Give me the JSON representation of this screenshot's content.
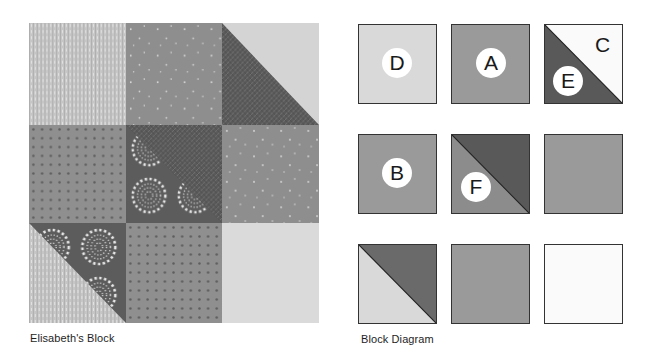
{
  "photo": {
    "caption": "Elisabeth's Block",
    "grid": [
      [
        "text-print-light",
        "sprinkle-medium",
        "hst-crosshatch-dark/light"
      ],
      [
        "dot-medium",
        "hst-flower-dark/crosshatch-dark",
        "sprinkle-medium"
      ],
      [
        "hst-text-light/flower-dark",
        "dot-medium",
        "solid-light"
      ]
    ]
  },
  "diagram": {
    "caption": "Block Diagram",
    "colors": {
      "light": "#d9d9d9",
      "medium": "#9a9a9a",
      "dark": "#595959",
      "white": "#fafafa",
      "outline": "#333333"
    },
    "cells": [
      {
        "row": 1,
        "col": 1,
        "type": "square",
        "label": "D"
      },
      {
        "row": 1,
        "col": 2,
        "type": "square",
        "label": "A"
      },
      {
        "row": 1,
        "col": 3,
        "type": "half-square-triangle",
        "labels": [
          "C",
          "E"
        ]
      },
      {
        "row": 2,
        "col": 1,
        "type": "square",
        "label": "B"
      },
      {
        "row": 2,
        "col": 2,
        "type": "half-square-triangle",
        "label": "F"
      },
      {
        "row": 2,
        "col": 3,
        "type": "square",
        "label": ""
      },
      {
        "row": 3,
        "col": 1,
        "type": "half-square-triangle",
        "label": ""
      },
      {
        "row": 3,
        "col": 2,
        "type": "square",
        "label": ""
      },
      {
        "row": 3,
        "col": 3,
        "type": "square",
        "label": ""
      }
    ],
    "labels": {
      "d": "D",
      "a": "A",
      "c": "C",
      "e": "E",
      "b": "B",
      "f": "F"
    }
  }
}
